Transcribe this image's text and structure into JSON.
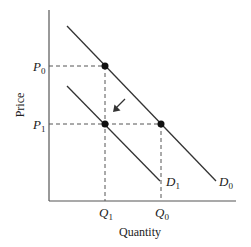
{
  "diagram": {
    "type": "supply-demand shift",
    "axes": {
      "x_label": "Quantity",
      "y_label": "Price"
    },
    "price_levels": [
      {
        "id": "P0",
        "letter": "P",
        "sub": "0"
      },
      {
        "id": "P1",
        "letter": "P",
        "sub": "1"
      }
    ],
    "quantity_levels": [
      {
        "id": "Q1",
        "letter": "Q",
        "sub": "1"
      },
      {
        "id": "Q0",
        "letter": "Q",
        "sub": "0"
      }
    ],
    "curves": [
      {
        "id": "D0",
        "letter": "D",
        "sub": "0",
        "description": "original demand curve"
      },
      {
        "id": "D1",
        "letter": "D",
        "sub": "1",
        "description": "shifted demand curve (leftward)"
      }
    ],
    "points": [
      {
        "label": "D0 at (Q1, P0)"
      },
      {
        "label": "D1 at (Q1, P1)"
      },
      {
        "label": "D0 at (Q0, P1)"
      }
    ],
    "arrow": {
      "direction": "down-left",
      "meaning": "demand shifts from D0 to D1"
    },
    "colors": {
      "line": "#333333",
      "dash": "#555555",
      "point": "#111111"
    }
  }
}
